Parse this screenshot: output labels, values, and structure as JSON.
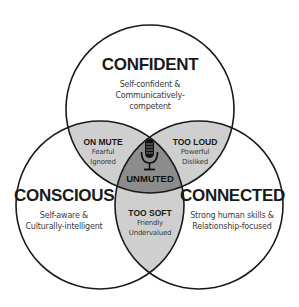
{
  "diagram": {
    "type": "venn",
    "circles": [
      {
        "id": "confident",
        "title": "CONFIDENT",
        "desc_lines": [
          "Self-confident &",
          "Communicatively-",
          "competent"
        ]
      },
      {
        "id": "conscious",
        "title": "CONSCIOUS",
        "desc_lines": [
          "Self-aware &",
          "Culturally-intelligent"
        ]
      },
      {
        "id": "connected",
        "title": "CONNECTED",
        "desc_lines": [
          "Strong human skills &",
          "Relationship-focused"
        ]
      }
    ],
    "overlaps": [
      {
        "id": "on-mute",
        "title": "ON MUTE",
        "desc_lines": [
          "Fearful",
          "Ignored"
        ]
      },
      {
        "id": "too-loud",
        "title": "TOO LOUD",
        "desc_lines": [
          "Powerful",
          "Disliked"
        ]
      },
      {
        "id": "too-soft",
        "title": "TOO SOFT",
        "desc_lines": [
          "Friendly",
          "Undervalued"
        ]
      }
    ],
    "center": {
      "title": "UNMUTED",
      "icon": "microphone-icon"
    },
    "colors": {
      "stroke": "#1a1a1a",
      "overlap_fill": "#cfcfcf",
      "center_fill": "#8c8c8c",
      "background": "#ffffff"
    }
  }
}
